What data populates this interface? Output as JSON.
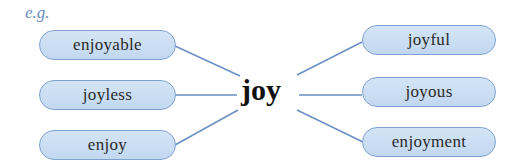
{
  "label": "e.g.",
  "center_word": "joy",
  "colors": {
    "line": "#6b8fc4",
    "pill_fill": "#c8dcf2",
    "pill_border": "#7ea2d0",
    "label": "#6a8cc6"
  },
  "left_words": [
    {
      "text": "enjoyable"
    },
    {
      "text": "joyless"
    },
    {
      "text": "enjoy"
    }
  ],
  "right_words": [
    {
      "text": "joyful"
    },
    {
      "text": "joyous"
    },
    {
      "text": "enjoyment"
    }
  ]
}
